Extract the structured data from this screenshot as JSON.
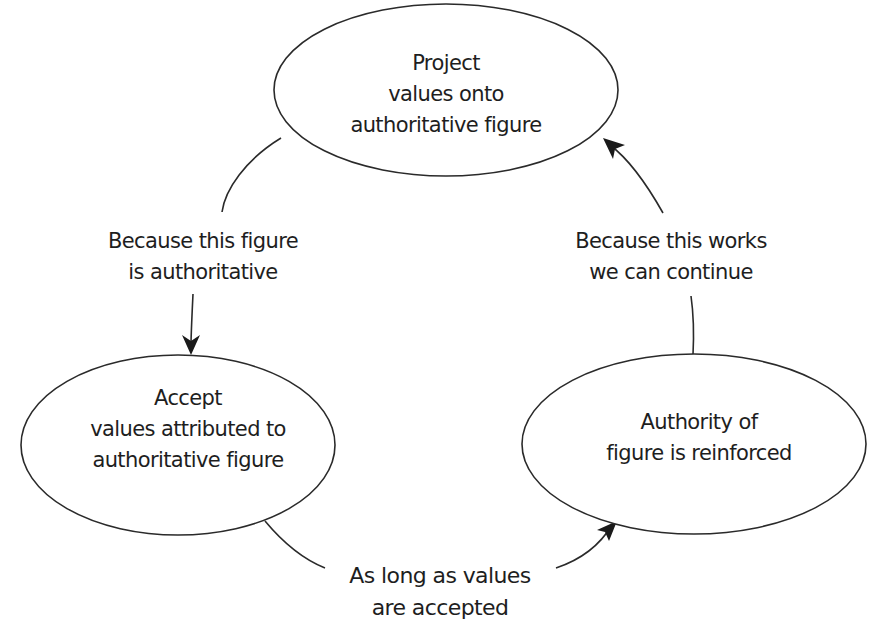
{
  "diagram": {
    "type": "cycle",
    "nodes": [
      {
        "id": "project",
        "lines": [
          "Project",
          "values onto",
          "authoritative figure"
        ]
      },
      {
        "id": "accept",
        "lines": [
          "Accept",
          "values attributed to",
          "authoritative figure"
        ]
      },
      {
        "id": "reinforce",
        "lines": [
          "Authority of",
          "figure is reinforced"
        ]
      }
    ],
    "edges": [
      {
        "from": "project",
        "to": "accept",
        "lines": [
          "Because this figure",
          "is authoritative"
        ]
      },
      {
        "from": "accept",
        "to": "reinforce",
        "lines": [
          "As long as values",
          "are accepted"
        ]
      },
      {
        "from": "reinforce",
        "to": "project",
        "lines": [
          "Because this works",
          "we can continue"
        ]
      }
    ],
    "colors": {
      "line": "#2a2a2a",
      "text": "#1e1e1e",
      "background": "#ffffff"
    }
  }
}
